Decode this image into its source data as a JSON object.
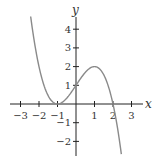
{
  "chart_data": {
    "type": "line",
    "title": "",
    "xlabel": "x",
    "ylabel": "y",
    "xlim": [
      -3.5,
      3.6
    ],
    "ylim": [
      -2.7,
      4.8
    ],
    "grid": false,
    "legend": null,
    "x_ticks": [
      -3,
      -2,
      -1,
      1,
      2,
      3
    ],
    "x_tick_labels": [
      "−3",
      "−2",
      "−1",
      "1",
      "2",
      "3"
    ],
    "y_ticks": [
      4,
      3,
      2,
      1,
      -1,
      -2
    ],
    "y_tick_labels": [
      "4",
      "3",
      "2",
      "1",
      "−1",
      "−2"
    ],
    "series": [
      {
        "name": "f(x) = -(x+1)^2 (x-2) / 2",
        "x": [
          -2.45,
          -2,
          -1.5,
          -1,
          -0.5,
          0,
          0.5,
          1,
          1.5,
          2,
          2.45
        ],
        "y": [
          4.6,
          2,
          0.44,
          0,
          0.31,
          1,
          1.69,
          2,
          1.56,
          0,
          -2.7
        ],
        "color": "#8a8a8a"
      }
    ],
    "key_points": [
      {
        "x": -1,
        "y": 0,
        "note": "double root / local minimum"
      },
      {
        "x": 0,
        "y": 1,
        "note": "y-intercept"
      },
      {
        "x": 1,
        "y": 2,
        "note": "local maximum"
      },
      {
        "x": 2,
        "y": 0,
        "note": "root"
      }
    ]
  },
  "labels": {
    "x_axis": "x",
    "y_axis": "y"
  }
}
